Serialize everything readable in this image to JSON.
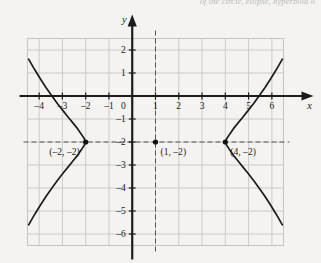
{
  "page": {
    "cutoff_header": "of the circle, ellipse, hyperbola o",
    "background_color": "#f2f1ef"
  },
  "figure": {
    "name": "hyperbola-graph",
    "axis_labels": {
      "x": "x",
      "y": "y"
    },
    "origin_label": "0",
    "x_tick_labels": [
      "–4",
      "–3",
      "–2",
      "–1",
      "1",
      "2",
      "3",
      "4",
      "5",
      "6"
    ],
    "y_tick_labels": [
      "2",
      "1",
      "–1",
      "–2",
      "–3",
      "–4",
      "–5",
      "–6"
    ],
    "point_labels": {
      "left_vertex": "(–2, –2)",
      "center": "(1, –2)",
      "right_vertex": "(4, –2)"
    },
    "colors": {
      "grid": "#c6c6c6",
      "axis": "#1c1c1c",
      "curve": "#1c1c1c",
      "dashed": "#555555",
      "point": "#111111"
    }
  },
  "chart_data": {
    "type": "line",
    "title": "",
    "xlabel": "x",
    "ylabel": "y",
    "xlim": [
      -4.5,
      6.5
    ],
    "ylim": [
      -6.5,
      2.5
    ],
    "xticks": [
      -4,
      -3,
      -2,
      -1,
      0,
      1,
      2,
      3,
      4,
      5,
      6
    ],
    "yticks": [
      2,
      1,
      0,
      -1,
      -2,
      -3,
      -4,
      -5,
      -6
    ],
    "grid": true,
    "legend": "none",
    "conic": {
      "kind": "hyperbola",
      "orientation": "horizontal",
      "center": [
        1,
        -2
      ],
      "a": 3,
      "b": 3,
      "vertices": [
        [
          -2,
          -2
        ],
        [
          4,
          -2
        ]
      ],
      "equation": "(x-1)^2/9 - (y+2)^2/9 = 1"
    },
    "annotations": [
      {
        "point": [
          -2,
          -2
        ],
        "text": "(–2, –2)"
      },
      {
        "point": [
          1,
          -2
        ],
        "text": "(1, –2)"
      },
      {
        "point": [
          4,
          -2
        ],
        "text": "(4, –2)"
      }
    ],
    "reference_lines": [
      {
        "type": "vertical",
        "value": 1,
        "style": "dashed"
      },
      {
        "type": "horizontal",
        "value": -2,
        "style": "dashed"
      }
    ],
    "series": [
      {
        "name": "left-branch",
        "points": [
          [
            -4.45,
            -5.6
          ],
          [
            -4.2,
            -5.16
          ],
          [
            -3.95,
            -4.75
          ],
          [
            -3.7,
            -4.36
          ],
          [
            -3.45,
            -4.0
          ],
          [
            -3.2,
            -3.65
          ],
          [
            -2.95,
            -3.33
          ],
          [
            -2.75,
            -3.08
          ],
          [
            -2.55,
            -2.83
          ],
          [
            -2.35,
            -2.58
          ],
          [
            -2.18,
            -2.33
          ],
          [
            -2.06,
            -2.14
          ],
          [
            -2.0,
            -2.0
          ],
          [
            -2.06,
            -1.86
          ],
          [
            -2.18,
            -1.67
          ],
          [
            -2.35,
            -1.42
          ],
          [
            -2.55,
            -1.17
          ],
          [
            -2.75,
            -0.92
          ],
          [
            -2.95,
            -0.67
          ],
          [
            -3.2,
            -0.35
          ],
          [
            -3.45,
            0.0
          ],
          [
            -3.7,
            0.36
          ],
          [
            -3.95,
            0.75
          ],
          [
            -4.2,
            1.16
          ],
          [
            -4.45,
            1.6
          ]
        ]
      },
      {
        "name": "right-branch",
        "points": [
          [
            6.45,
            -5.6
          ],
          [
            6.2,
            -5.16
          ],
          [
            5.95,
            -4.75
          ],
          [
            5.7,
            -4.36
          ],
          [
            5.45,
            -4.0
          ],
          [
            5.2,
            -3.65
          ],
          [
            4.95,
            -3.33
          ],
          [
            4.75,
            -3.08
          ],
          [
            4.55,
            -2.83
          ],
          [
            4.35,
            -2.58
          ],
          [
            4.18,
            -2.33
          ],
          [
            4.06,
            -2.14
          ],
          [
            4.0,
            -2.0
          ],
          [
            4.06,
            -1.86
          ],
          [
            4.18,
            -1.67
          ],
          [
            4.35,
            -1.42
          ],
          [
            4.55,
            -1.17
          ],
          [
            4.75,
            -0.92
          ],
          [
            4.95,
            -0.67
          ],
          [
            5.2,
            -0.35
          ],
          [
            5.45,
            0.0
          ],
          [
            5.7,
            0.36
          ],
          [
            5.95,
            0.75
          ],
          [
            6.2,
            1.16
          ],
          [
            6.45,
            1.6
          ]
        ]
      }
    ]
  }
}
